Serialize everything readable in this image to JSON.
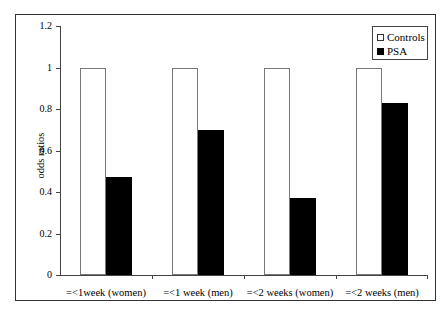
{
  "chart_data": {
    "type": "bar",
    "title": "",
    "xlabel": "",
    "ylabel": "odds ratios",
    "ylim": [
      0,
      1.2
    ],
    "yticks": [
      "0",
      "0.2",
      "0.4",
      "0.6",
      "0.8",
      "1",
      "1.2"
    ],
    "grid": false,
    "legend_position": "top-right",
    "categories": [
      "=<1week (women)",
      "=<1 week (men)",
      "=<2 weeks (women)",
      "=<2 weeks (men)"
    ],
    "series": [
      {
        "name": "Controls",
        "color": "#ffffff",
        "values": [
          1,
          1,
          1,
          1
        ]
      },
      {
        "name": "PSA",
        "color": "#000000",
        "values": [
          0.47,
          0.7,
          0.37,
          0.83
        ]
      }
    ]
  },
  "legend": {
    "controls": "Controls",
    "psa": "PSA"
  }
}
